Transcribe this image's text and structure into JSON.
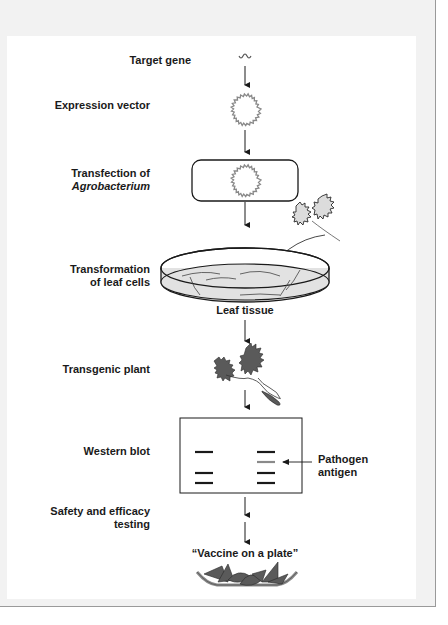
{
  "figure": {
    "steps": [
      {
        "label": "Target gene"
      },
      {
        "label": "Expression vector"
      },
      {
        "label_line1": "Transfection of",
        "label_line2": "Agrobacterium"
      },
      {
        "label_line1": "Transformation",
        "label_line2": "of leaf cells",
        "sublabel": "Leaf tissue"
      },
      {
        "label": "Transgenic plant"
      },
      {
        "label": "Western blot"
      },
      {
        "label_line1": "Safety and efficacy",
        "label_line2": "testing"
      }
    ],
    "western_blot": {
      "columns": [
        "Control\nplant",
        "Transgenic\nplant"
      ],
      "control_header_line1": "Control",
      "control_header_line2": "plant",
      "transgenic_header_line1": "Transgenic",
      "transgenic_header_line2": "plant",
      "annotation_line1": "Pathogen",
      "annotation_line2": "antigen"
    },
    "final_label": "“Vaccine on a plate”",
    "colors": {
      "frame_bg": "#f2f2f2",
      "panel_bg": "#ffffff",
      "line": "#1a1a1a",
      "leaf_fill": "#5a5a5a",
      "dish_fill": "#e2e2e2",
      "antigen_band": "#8a8a8a"
    }
  }
}
